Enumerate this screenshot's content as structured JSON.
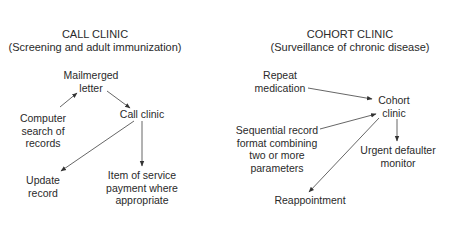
{
  "left_panel": {
    "title": "CALL CLINIC",
    "subtitle": "(Screening and adult immunization)",
    "nodes": {
      "mailmerged_letter": [
        "Mailmerged",
        "letter"
      ],
      "computer_search": [
        "Computer",
        "search of",
        "records"
      ],
      "call_clinic": [
        "Call clinic"
      ],
      "update_record": [
        "Update",
        "record"
      ],
      "item_of_service": [
        "Item of service",
        "payment where",
        "appropriate"
      ]
    }
  },
  "right_panel": {
    "title": "COHORT CLINIC",
    "subtitle": "(Surveillance of chronic disease)",
    "nodes": {
      "repeat_medication": [
        "Repeat",
        "medication"
      ],
      "cohort_clinic": [
        "Cohort",
        "clinic"
      ],
      "sequential_record": [
        "Sequential record",
        "format combining",
        "two or more",
        "parameters"
      ],
      "urgent_defaulter": [
        "Urgent defaulter",
        "monitor"
      ],
      "reappointment": [
        "Reappointment"
      ]
    }
  },
  "colors": {
    "text": "#2a2a2a",
    "arrow": "#444444"
  }
}
